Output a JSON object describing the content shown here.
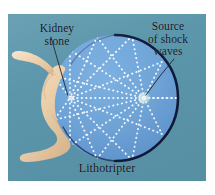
{
  "figure": {
    "background_color": "#ffffff",
    "panel_color": "#5b96ab",
    "ellipse_fill_color": "#6fa5da",
    "ellipse_outline_color": "#121a3a",
    "ray_color": "#ffffff",
    "body_color": "#f0d6b8",
    "text_color": "#15161d"
  },
  "labels": {
    "kidney_stone": {
      "line1": "Kidney",
      "line2": "stone"
    },
    "source": {
      "line1": "Source",
      "line2": "of shock",
      "line3": "waves"
    },
    "lithotripter": "Lithotripter"
  },
  "diagram": {
    "ellipse": {
      "center_x": 107,
      "center_y": 84,
      "radius_x": 63,
      "radius_y": 63
    },
    "focus_stone": {
      "x": 62,
      "y": 84,
      "label": "kidney-stone-focus"
    },
    "focus_source": {
      "x": 136,
      "y": 84,
      "label": "shock-wave-source-focus"
    },
    "ray_count": 9,
    "ray_style": "dotted",
    "patient": {
      "position": "left",
      "orientation": "reclining"
    }
  }
}
